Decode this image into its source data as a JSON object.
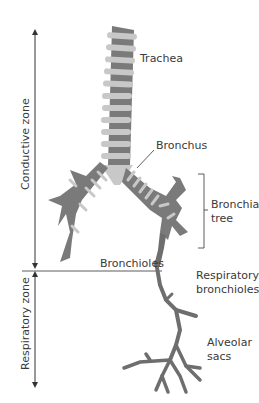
{
  "diagram": {
    "type": "anatomy-airway",
    "zones": [
      {
        "label": "Conductive zone",
        "arrow": "double-headed-vertical"
      },
      {
        "label": "Respiratory zone",
        "arrow": "double-headed-vertical"
      }
    ],
    "labels": {
      "trachea": "Trachea",
      "bronchus": "Bronchus",
      "bronchial_tree_line1": "Bronchial",
      "bronchial_tree_line2": "tree",
      "bronchioles": "Bronchioles",
      "respiratory_bronchioles_line1": "Respiratory",
      "respiratory_bronchioles_line2": "bronchioles",
      "alveolar_sacs_line1": "Alveolar",
      "alveolar_sacs_line2": "sacs"
    },
    "colors": {
      "ring_light": "#c8c8c8",
      "tube_dark": "#7a7a7a",
      "branch_gray": "#6e6e6e",
      "line": "#333333",
      "text": "#3a3a3a"
    }
  }
}
